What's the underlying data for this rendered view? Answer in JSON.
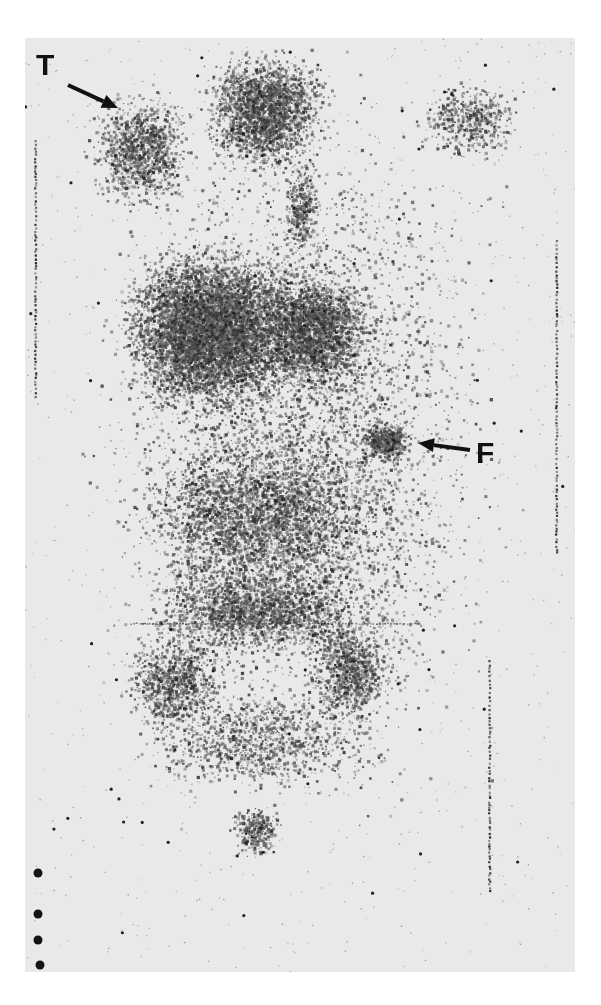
{
  "image": {
    "kind": "nuclear-medicine whole-body scintigram (anterior view)",
    "width": 601,
    "height": 1005,
    "border_color": "#ffffff",
    "film_color": "#e9e9e9",
    "dot_color": "#1a1a1a",
    "film_rect": [
      25,
      38,
      550,
      934
    ]
  },
  "annotations": [
    {
      "id": "T",
      "label": "T",
      "label_pos": [
        36,
        50
      ],
      "arrow_from": [
        68,
        85
      ],
      "arrow_to": [
        118,
        108
      ]
    },
    {
      "id": "F",
      "label": "F",
      "label_pos": [
        476,
        438
      ],
      "arrow_from": [
        470,
        450
      ],
      "arrow_to": [
        418,
        443
      ]
    }
  ],
  "regions": [
    {
      "name": "head-upper-center",
      "cx": 265,
      "cy": 110,
      "rx": 70,
      "ry": 70,
      "density": 0.55
    },
    {
      "name": "thyroid-neck-left",
      "cx": 140,
      "cy": 150,
      "rx": 60,
      "ry": 70,
      "density": 0.32
    },
    {
      "name": "upper-right-shoulder",
      "cx": 470,
      "cy": 120,
      "rx": 60,
      "ry": 50,
      "density": 0.18
    },
    {
      "name": "spine-upper",
      "cx": 300,
      "cy": 210,
      "rx": 20,
      "ry": 60,
      "density": 0.32
    },
    {
      "name": "liver",
      "cx": 210,
      "cy": 330,
      "rx": 105,
      "ry": 95,
      "density": 0.75
    },
    {
      "name": "liver-right-lobe",
      "cx": 310,
      "cy": 330,
      "rx": 70,
      "ry": 70,
      "density": 0.58
    },
    {
      "name": "focus-F",
      "cx": 385,
      "cy": 440,
      "rx": 30,
      "ry": 25,
      "density": 0.75
    },
    {
      "name": "abdomen",
      "cx": 260,
      "cy": 520,
      "rx": 150,
      "ry": 100,
      "density": 0.22
    },
    {
      "name": "pelvis",
      "cx": 260,
      "cy": 610,
      "rx": 140,
      "ry": 50,
      "density": 0.3
    },
    {
      "name": "hip-left",
      "cx": 175,
      "cy": 680,
      "rx": 60,
      "ry": 60,
      "density": 0.3
    },
    {
      "name": "hip-right",
      "cx": 350,
      "cy": 670,
      "rx": 50,
      "ry": 60,
      "density": 0.35
    },
    {
      "name": "legs",
      "cx": 260,
      "cy": 740,
      "rx": 150,
      "ry": 60,
      "density": 0.14
    },
    {
      "name": "bladder-lower",
      "cx": 255,
      "cy": 830,
      "rx": 28,
      "ry": 30,
      "density": 0.42
    },
    {
      "name": "diffuse-body",
      "cx": 300,
      "cy": 450,
      "rx": 230,
      "ry": 420,
      "density": 0.06
    }
  ],
  "marker_lines": [
    {
      "name": "left-vertical-marker",
      "x": 35,
      "y1": 140,
      "y2": 400
    },
    {
      "name": "right-vertical-marker-upper",
      "x": 556,
      "y1": 240,
      "y2": 555
    },
    {
      "name": "right-vertical-marker-lower",
      "x": 489,
      "y1": 660,
      "y2": 890
    }
  ],
  "horizontal_artifact": {
    "x1": 130,
    "x2": 420,
    "y": 623
  },
  "fiducial_dots": [
    [
      38,
      873
    ],
    [
      38,
      914
    ],
    [
      38,
      940
    ],
    [
      40,
      965
    ]
  ]
}
